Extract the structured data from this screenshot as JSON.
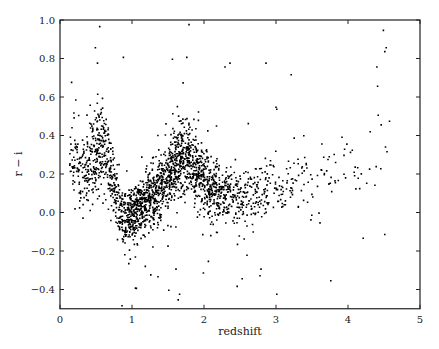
{
  "chart_data": {
    "type": "scatter",
    "title": "",
    "xlabel": "redshift",
    "ylabel": "r − i",
    "xlim": [
      0,
      5
    ],
    "ylim": [
      -0.5,
      1.0
    ],
    "xticks": [
      0,
      1,
      2,
      3,
      4,
      5
    ],
    "xtick_labels": [
      "0",
      "1",
      "2",
      "3",
      "4",
      "5"
    ],
    "yticks": [
      -0.4,
      -0.2,
      0.0,
      0.2,
      0.4,
      0.6,
      0.8,
      1.0
    ],
    "ytick_labels": [
      "−0.4",
      "−0.2",
      "0.0",
      "0.2",
      "0.4",
      "0.6",
      "0.8",
      "1.0"
    ],
    "grid": false,
    "legend": null,
    "marker": {
      "color": "#000000",
      "size": 1.6
    },
    "trend_ridge": {
      "description": "Mean r-i color vs redshift (quasar color track), estimated from point density",
      "x": [
        0.15,
        0.3,
        0.45,
        0.55,
        0.65,
        0.8,
        0.9,
        1.0,
        1.2,
        1.4,
        1.6,
        1.75,
        1.9,
        2.1,
        2.3,
        2.5,
        2.8,
        3.2,
        3.6,
        4.0,
        4.4
      ],
      "y": [
        0.3,
        0.2,
        0.3,
        0.35,
        0.28,
        0.05,
        -0.02,
        0.0,
        0.05,
        0.15,
        0.25,
        0.3,
        0.22,
        0.12,
        0.08,
        0.08,
        0.1,
        0.15,
        0.2,
        0.22,
        0.35
      ],
      "spread": [
        0.14,
        0.12,
        0.14,
        0.14,
        0.14,
        0.09,
        0.08,
        0.08,
        0.09,
        0.1,
        0.1,
        0.11,
        0.11,
        0.09,
        0.08,
        0.08,
        0.09,
        0.1,
        0.1,
        0.11,
        0.15
      ],
      "relative_density": [
        0.25,
        0.35,
        0.8,
        0.9,
        0.6,
        0.6,
        0.85,
        1.0,
        1.0,
        0.95,
        1.0,
        1.0,
        0.9,
        0.75,
        0.5,
        0.35,
        0.2,
        0.1,
        0.05,
        0.04,
        0.03
      ]
    },
    "approx_point_count": 9000,
    "outliers": [
      {
        "x": 0.54,
        "y": 0.97
      },
      {
        "x": 0.48,
        "y": 0.86
      },
      {
        "x": 0.51,
        "y": 0.78
      },
      {
        "x": 0.15,
        "y": 0.68
      },
      {
        "x": 0.87,
        "y": 0.81
      },
      {
        "x": 1.78,
        "y": 0.98
      },
      {
        "x": 1.55,
        "y": 0.8
      },
      {
        "x": 1.75,
        "y": 0.81
      },
      {
        "x": 2.35,
        "y": 0.78
      },
      {
        "x": 2.28,
        "y": 0.76
      },
      {
        "x": 2.85,
        "y": 0.78
      },
      {
        "x": 3.2,
        "y": 0.72
      },
      {
        "x": 4.48,
        "y": 0.95
      },
      {
        "x": 4.52,
        "y": 0.86
      },
      {
        "x": 4.5,
        "y": 0.84
      },
      {
        "x": 4.39,
        "y": 0.76
      },
      {
        "x": 4.4,
        "y": 0.66
      },
      {
        "x": 3.0,
        "y": 0.54
      },
      {
        "x": 1.25,
        "y": -0.32
      },
      {
        "x": 1.35,
        "y": -0.33
      },
      {
        "x": 1.6,
        "y": -0.29
      },
      {
        "x": 1.5,
        "y": -0.4
      },
      {
        "x": 0.85,
        "y": -0.48
      },
      {
        "x": 1.65,
        "y": -0.42
      },
      {
        "x": 1.63,
        "y": -0.45
      },
      {
        "x": 2.78,
        "y": -0.29
      },
      {
        "x": 2.45,
        "y": -0.38
      },
      {
        "x": 2.52,
        "y": -0.34
      },
      {
        "x": 3.0,
        "y": -0.42
      },
      {
        "x": 3.75,
        "y": -0.35
      },
      {
        "x": 4.2,
        "y": -0.13
      },
      {
        "x": 4.5,
        "y": -0.11
      },
      {
        "x": 3.6,
        "y": -0.05
      },
      {
        "x": 2.05,
        "y": -0.25
      },
      {
        "x": 1.98,
        "y": -0.31
      },
      {
        "x": 1.05,
        "y": -0.39
      }
    ]
  }
}
